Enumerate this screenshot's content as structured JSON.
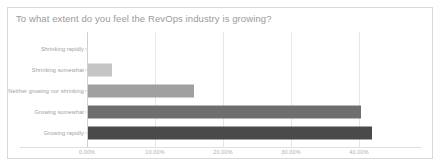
{
  "chart_data": {
    "type": "bar",
    "orientation": "horizontal",
    "title": "To what extent do you feel the RevOps industry is growing?",
    "xlabel": "",
    "ylabel": "",
    "categories": [
      "Shrinking rapidly",
      "Shrinking somewhat",
      "Neither growing nor shrinking",
      "Growing somewhat",
      "Growing rapidly"
    ],
    "values": [
      0.0,
      3.5,
      15.6,
      40.2,
      41.7
    ],
    "value_unit": "%",
    "xlim": [
      0,
      45
    ],
    "xticks": [
      0,
      10,
      20,
      30,
      40
    ],
    "xtick_labels": [
      "0.00%",
      "10.00%",
      "20.00%",
      "30.00%",
      "40.00%"
    ],
    "grid": true,
    "legend": false,
    "bar_colors": [
      "#c9c9c9",
      "#c5c5c5",
      "#a0a0a0",
      "#6e6e6e",
      "#4a4a4a"
    ],
    "colors": {
      "card_border": "#d8d8d8",
      "background": "#ffffff",
      "title_text": "#9a9a9a",
      "tick_text": "#b0b0b0",
      "category_text": "#9d9d9d",
      "gridline": "#e6e6e6",
      "axis_line": "#cfcfcf"
    }
  }
}
